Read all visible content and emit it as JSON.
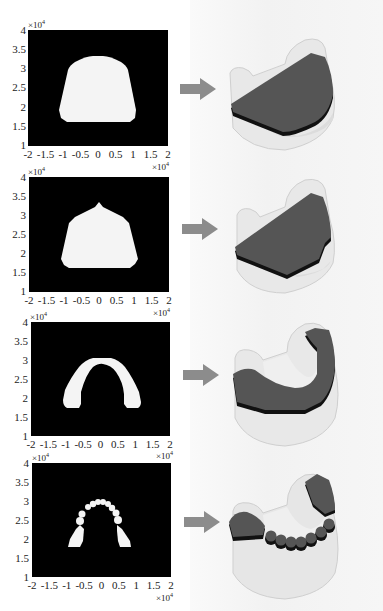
{
  "figure": {
    "panels": [
      {
        "id": 1,
        "shape": "full-palate-rounded",
        "y_ticks": [
          "4",
          "3.5",
          "3",
          "2.5",
          "2",
          "1.5",
          "1"
        ],
        "x_ticks": [
          "-2",
          "-1.5",
          "-1",
          "-0.5",
          "0",
          "0.5",
          "1",
          "1.5",
          "2"
        ],
        "y_exponent": "×10",
        "y_exp_power": "4",
        "x_exponent": "×10",
        "x_exp_power": "4",
        "result": "full dark plate filling arch"
      },
      {
        "id": 2,
        "shape": "full-palate-peaked",
        "y_ticks": [
          "4",
          "3.5",
          "3",
          "2.5",
          "2",
          "1.5",
          "1"
        ],
        "x_ticks": [
          "-2",
          "-1.5",
          "-1",
          "-0.5",
          "0",
          "0.5",
          "1",
          "1.5",
          "2"
        ],
        "y_exponent": "×10",
        "y_exp_power": "4",
        "x_exponent": "×10",
        "x_exp_power": "4",
        "result": "full dark plate with peak"
      },
      {
        "id": 3,
        "shape": "horseshoe-arch",
        "y_ticks": [
          "4",
          "3.5",
          "3",
          "2.5",
          "2",
          "1.5",
          "1"
        ],
        "x_ticks": [
          "-2",
          "-1.5",
          "-1",
          "-0.5",
          "0",
          "0.5",
          "1",
          "1.5",
          "2"
        ],
        "y_exponent": "×10",
        "y_exp_power": "4",
        "x_exponent": "×10",
        "x_exp_power": "4",
        "result": "horseshoe dark band"
      },
      {
        "id": 4,
        "shape": "tooth-chain-arch",
        "y_ticks": [
          "4",
          "3.5",
          "3",
          "2.5",
          "2",
          "1.5",
          "1"
        ],
        "x_ticks": [
          "-2",
          "-1.5",
          "-1",
          "-0.5",
          "0",
          "0.5",
          "1",
          "1.5",
          "2"
        ],
        "y_exponent": "×10",
        "y_exp_power": "4",
        "x_exponent": "×10",
        "x_exp_power": "4",
        "result": "segmented tooth outline"
      }
    ],
    "arrow_icon": "right-arrow",
    "colors": {
      "plot_bg": "#000000",
      "mask_fill": "#f4f4f4",
      "arrow": "#8c8c8c",
      "plate_top": "#555555",
      "plate_edge": "#111111",
      "model_body": "#e6e6e6"
    }
  }
}
